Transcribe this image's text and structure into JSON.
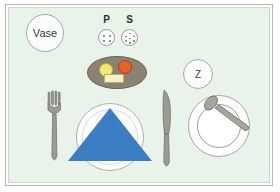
{
  "scene": {
    "title": "Place Setting Diagram",
    "background_color": "#e9f3e9",
    "frame_color": "#b9b2c4"
  },
  "labels": {
    "vase": "Vase",
    "pepper": "P",
    "salt": "S",
    "cup_marker": "Z"
  },
  "objects": {
    "vase_circle": "vase-placeholder",
    "pepper_shaker": "pepper-shaker",
    "salt_shaker": "salt-shaker",
    "platter": "oval-platter",
    "food_egg": "yellow-round-food",
    "food_tomato": "orange-round-food",
    "food_butter": "butter-pat",
    "plate": "dinner-plate",
    "napkin": "blue-triangle-napkin",
    "fork": "dinner-fork",
    "knife": "dinner-knife",
    "saucer": "saucer",
    "cup": "cup",
    "spoon": "teaspoon"
  },
  "colors": {
    "napkin_blue": "#3b7ec4",
    "platter_brown": "#8b8274",
    "egg_yellow": "#f4e873",
    "tomato_orange": "#e8622c",
    "butter_cream": "#f7f0c2",
    "cutlery_gray": "#9b9b93",
    "background": "#e9f3e9"
  },
  "shaker_holes": {
    "pepper_count": 4,
    "salt_count": 7
  }
}
